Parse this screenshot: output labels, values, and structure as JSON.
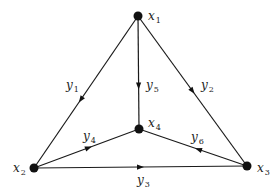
{
  "diagram": {
    "type": "directed-graph",
    "colors": {
      "line": "#1a1a1a",
      "node": "#111111",
      "text": "#222222",
      "background": "#ffffff"
    },
    "nodes": [
      {
        "id": "x1",
        "base": "x",
        "sub": "1",
        "cx": 138,
        "cy": 16,
        "lx": 148,
        "ly": 20
      },
      {
        "id": "x2",
        "base": "x",
        "sub": "2",
        "cx": 34,
        "cy": 168,
        "lx": 13,
        "ly": 172
      },
      {
        "id": "x3",
        "base": "x",
        "sub": "3",
        "cx": 247,
        "cy": 166,
        "lx": 257,
        "ly": 172
      },
      {
        "id": "x4",
        "base": "x",
        "sub": "4",
        "cx": 139,
        "cy": 129,
        "lx": 148,
        "ly": 127
      }
    ],
    "edges": [
      {
        "id": "y1",
        "base": "y",
        "sub": "1",
        "from": "x1",
        "to": "x2",
        "lx": 66,
        "ly": 89,
        "arrow_t": 0.55
      },
      {
        "id": "y2",
        "base": "y",
        "sub": "2",
        "from": "x1",
        "to": "x3",
        "lx": 201,
        "ly": 89,
        "arrow_t": 0.5
      },
      {
        "id": "y3",
        "base": "y",
        "sub": "3",
        "from": "x2",
        "to": "x3",
        "lx": 137,
        "ly": 184,
        "arrow_t": 0.5
      },
      {
        "id": "y4",
        "base": "y",
        "sub": "4",
        "from": "x2",
        "to": "x4",
        "lx": 83,
        "ly": 140,
        "arrow_t": 0.52
      },
      {
        "id": "y5",
        "base": "y",
        "sub": "5",
        "from": "x1",
        "to": "x4",
        "lx": 146,
        "ly": 89,
        "arrow_t": 0.62
      },
      {
        "id": "y6",
        "base": "y",
        "sub": "6",
        "from": "x3",
        "to": "x4",
        "lx": 191,
        "ly": 141,
        "arrow_t": 0.45
      }
    ]
  }
}
